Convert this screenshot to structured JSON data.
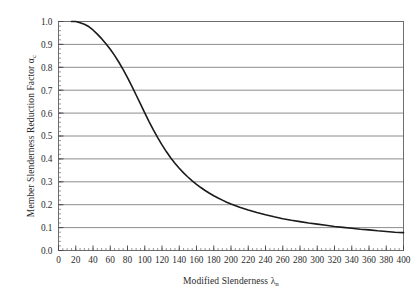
{
  "chart_data": {
    "type": "line",
    "title": "",
    "xlabel": "Modified Slenderness",
    "xlabel_symbol": "λ",
    "xlabel_symbol_sub": "n",
    "ylabel": "Member Slenderness Reduction Factor",
    "ylabel_symbol": "α",
    "ylabel_symbol_sub": "c",
    "xlim": [
      0,
      400
    ],
    "ylim": [
      0,
      1.0
    ],
    "xticks": [
      0,
      20,
      40,
      60,
      80,
      100,
      120,
      140,
      160,
      180,
      200,
      220,
      240,
      260,
      280,
      300,
      320,
      340,
      360,
      380,
      400
    ],
    "yticks": [
      "0.0",
      "0.1",
      "0.2",
      "0.3",
      "0.4",
      "0.5",
      "0.6",
      "0.7",
      "0.8",
      "0.9",
      "1.0"
    ],
    "xtick_labels": [
      "0",
      "20",
      "40",
      "60",
      "80",
      "100",
      "120",
      "140",
      "160",
      "180",
      "200",
      "220",
      "240",
      "260",
      "280",
      "300",
      "320",
      "340",
      "360",
      "380",
      "400"
    ],
    "x_minor_tick_step": 5,
    "y_minor_tick_step": 0.02,
    "grid": "horizontal",
    "grid_color": "#808080",
    "frame_color": "#6e6e6e",
    "legend": null,
    "series": [
      {
        "name": "Member slenderness reduction factor",
        "color": "#1a1a1a",
        "line_width": 1.6,
        "x": [
          15,
          20,
          25,
          30,
          35,
          40,
          45,
          50,
          55,
          60,
          65,
          70,
          75,
          80,
          85,
          90,
          95,
          100,
          105,
          110,
          115,
          120,
          125,
          130,
          135,
          140,
          145,
          150,
          155,
          160,
          165,
          170,
          175,
          180,
          185,
          190,
          195,
          200,
          210,
          220,
          230,
          240,
          250,
          260,
          270,
          280,
          290,
          300,
          310,
          320,
          330,
          340,
          350,
          360,
          370,
          380,
          390,
          400
        ],
        "y": [
          1.0,
          1.0,
          0.995,
          0.988,
          0.978,
          0.963,
          0.945,
          0.925,
          0.903,
          0.879,
          0.852,
          0.822,
          0.79,
          0.755,
          0.718,
          0.679,
          0.64,
          0.601,
          0.563,
          0.527,
          0.493,
          0.461,
          0.432,
          0.405,
          0.381,
          0.359,
          0.339,
          0.321,
          0.304,
          0.289,
          0.275,
          0.262,
          0.25,
          0.239,
          0.229,
          0.22,
          0.211,
          0.203,
          0.189,
          0.177,
          0.166,
          0.156,
          0.147,
          0.139,
          0.132,
          0.126,
          0.12,
          0.115,
          0.11,
          0.105,
          0.101,
          0.097,
          0.093,
          0.09,
          0.086,
          0.083,
          0.08,
          0.078
        ]
      }
    ]
  }
}
